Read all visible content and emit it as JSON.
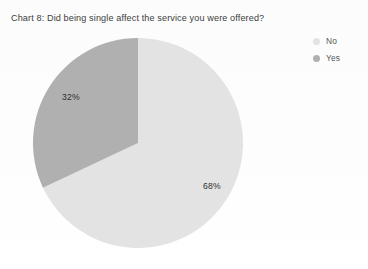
{
  "chart_data": {
    "type": "pie",
    "title": "Chart 8: Did being single affect the service you were offered?",
    "xlabel": "",
    "ylabel": "",
    "categories": [
      "No",
      "Yes"
    ],
    "values": [
      68,
      32
    ],
    "unit": "%",
    "data_labels": [
      "68%",
      "32%"
    ],
    "colors": [
      "#e3e3e3",
      "#b0b0b0"
    ],
    "legend_position": "right",
    "grid": false,
    "start_angle_deg": 0,
    "direction": "clockwise",
    "slices": [
      {
        "label": "No",
        "value": 68,
        "display": "68%",
        "color": "#e3e3e3"
      },
      {
        "label": "Yes",
        "value": 32,
        "display": "32%",
        "color": "#b0b0b0"
      }
    ]
  },
  "title": {
    "text": "Chart 8: Did being single affect the service you were offered?"
  },
  "labels": {
    "no": "68%",
    "yes": "32%"
  },
  "legend": {
    "items": [
      {
        "label": "No",
        "color": "#e3e3e3",
        "marker": "circle-marker"
      },
      {
        "label": "Yes",
        "color": "#b0b0b0",
        "marker": "circle-marker"
      }
    ]
  }
}
